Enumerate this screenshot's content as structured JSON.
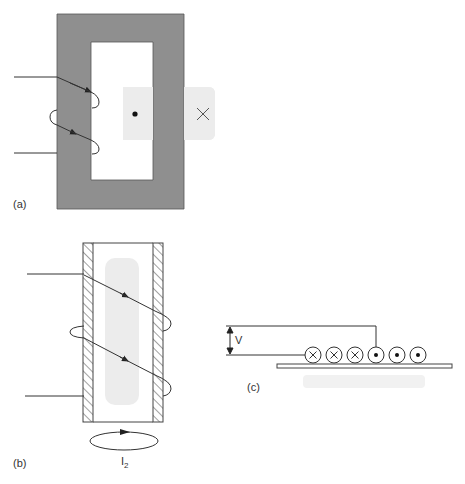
{
  "figure": {
    "panels": [
      {
        "id": "a",
        "label": "(a)",
        "description": "Rectangular magnetic core with two-turn winding on left leg; field into/out of page indicated on right leg",
        "symbols": [
          "dot",
          "cross"
        ]
      },
      {
        "id": "b",
        "label": "(b)",
        "description": "Hollow conducting cylinder with helical winding; induced circulating current below",
        "current_label": "I",
        "current_subscript": "2"
      },
      {
        "id": "c",
        "label": "(c)",
        "description": "Row of conductors above a conducting strip with voltage V across terminals",
        "voltage_label": "V",
        "conductors": [
          "cross",
          "cross",
          "cross",
          "dot",
          "dot",
          "dot"
        ]
      }
    ],
    "colors": {
      "core_fill": "#8f8f8f",
      "line": "#333333",
      "shade": "#ececec"
    }
  }
}
